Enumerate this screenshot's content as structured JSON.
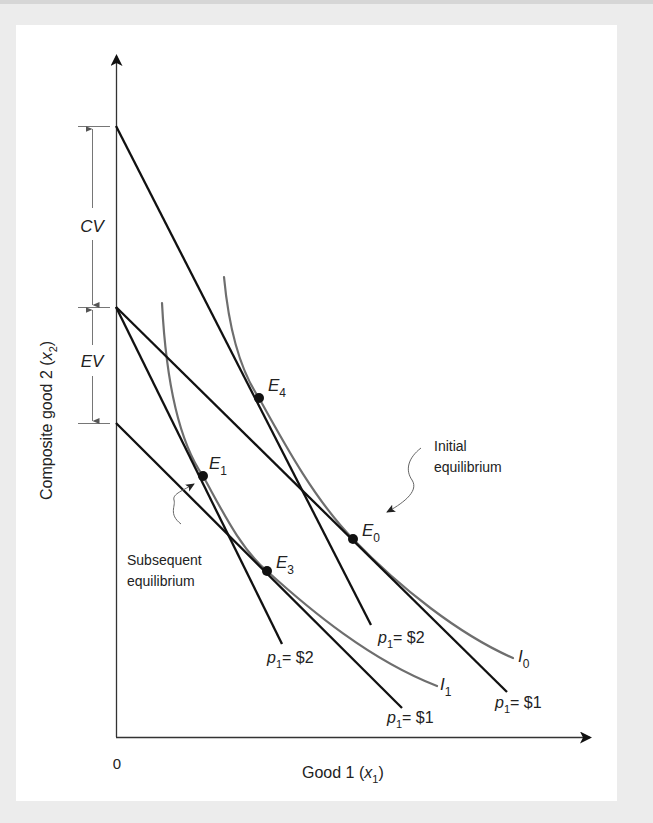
{
  "figure": {
    "y_axis_label": "Composite good 2",
    "y_axis_var": "x",
    "y_axis_sub": "2",
    "x_axis_label": "Good 1",
    "x_axis_var": "x",
    "x_axis_sub": "1",
    "origin_label": "0",
    "dimension_labels": {
      "cv": "CV",
      "ev": "EV"
    },
    "points": {
      "e0": {
        "letter": "E",
        "sub": "0"
      },
      "e1": {
        "letter": "E",
        "sub": "1"
      },
      "e3": {
        "letter": "E",
        "sub": "3"
      },
      "e4": {
        "letter": "E",
        "sub": "4"
      }
    },
    "curves": {
      "i0": {
        "letter": "I",
        "sub": "0"
      },
      "i1": {
        "letter": "I",
        "sub": "1"
      }
    },
    "budget_labels": {
      "p_letter": "p",
      "p_sub": "1",
      "steep_low": "= $2",
      "steep_high": "= $2",
      "flat_low": "= $1",
      "flat_high": "= $1"
    },
    "annotations": {
      "initial_line1": "Initial",
      "initial_line2": "equilibrium",
      "subsequent_line1": "Subsequent",
      "subsequent_line2": "equilibrium"
    },
    "colors": {
      "line": "#111111",
      "curve": "#6e6e6e",
      "background": "#ececec",
      "panel": "#ffffff"
    }
  }
}
